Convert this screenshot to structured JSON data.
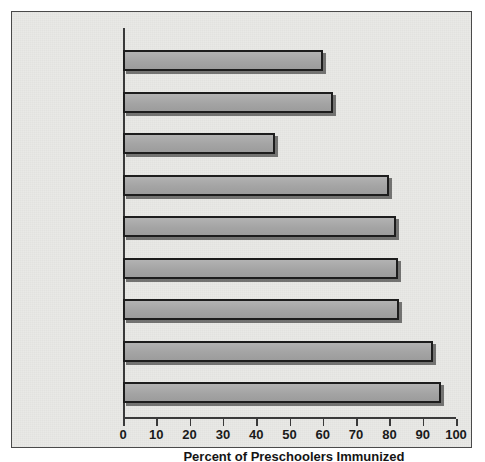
{
  "chart_data": {
    "type": "bar",
    "orientation": "horizontal",
    "title": "",
    "xlabel": "Percent of Preschoolers Immunized",
    "ylabel": "",
    "xlim": [
      0,
      100
    ],
    "xticks": [
      0,
      10,
      20,
      30,
      40,
      50,
      60,
      70,
      80,
      90,
      100
    ],
    "xticklabels": [
      "0",
      "10",
      "20",
      "30",
      "40",
      "50",
      "60",
      "70",
      "80",
      "90",
      "100"
    ],
    "grid": false,
    "legend": null,
    "categories": [
      "United States",
      "U.S. White",
      "U.S. Nonwhite",
      "West Germany",
      "Norway",
      "France",
      "Great Britain",
      "Denmark",
      "Holland"
    ],
    "values": [
      60,
      63,
      45.5,
      80,
      82,
      82.5,
      83,
      93,
      95.5
    ],
    "bar_color": "#a9a9a9",
    "bar_edge_color": "#1d1d1d",
    "background_color": "#e9e9e6",
    "axis_color": "#3a3a3a",
    "text_color": "#141414"
  }
}
